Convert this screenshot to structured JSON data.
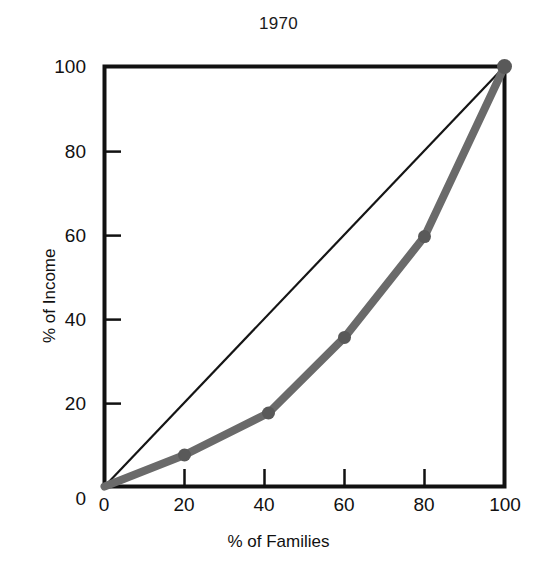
{
  "chart_data": {
    "type": "line",
    "title": "1970",
    "xlabel": "% of Families",
    "ylabel": "% of Income",
    "xlim": [
      0,
      100
    ],
    "ylim": [
      0,
      100
    ],
    "grid": false,
    "legend": "none",
    "xticks": [
      "0",
      "20",
      "40",
      "60",
      "80",
      "100"
    ],
    "xtick_values": [
      0,
      20,
      40,
      60,
      80,
      100
    ],
    "yticks": [
      "0",
      "20",
      "40",
      "60",
      "80",
      "100"
    ],
    "ytick_values": [
      0,
      20,
      40,
      60,
      80,
      100
    ],
    "series": [
      {
        "name": "Line of equality",
        "color": "#151515",
        "style": "thin-solid",
        "markers": false,
        "x": [
          0,
          100
        ],
        "values": [
          0,
          100
        ]
      },
      {
        "name": "Lorenz curve",
        "color": "#6a6a6a",
        "style": "thick-solid",
        "markers": true,
        "x": [
          0,
          20,
          41,
          60,
          80,
          100
        ],
        "values": [
          0,
          7.5,
          17.5,
          35.5,
          59.5,
          100
        ]
      }
    ],
    "annotations": []
  },
  "figure": {
    "background_color": "#ffffff",
    "frame_color": "#111111",
    "title": "1970",
    "x_axis_label": "% of Families",
    "y_axis_label": "% of Income"
  }
}
